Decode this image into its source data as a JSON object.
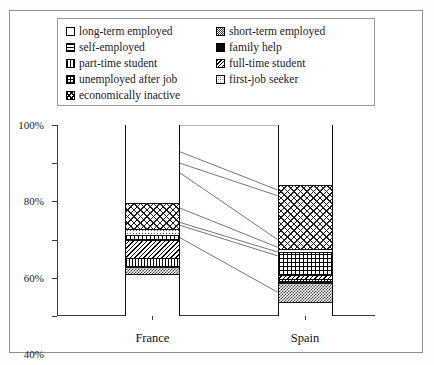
{
  "chart_data": {
    "type": "bar",
    "subtype": "stacked-percentage-with-connectors",
    "title": "",
    "xlabel": "",
    "ylabel": "",
    "categories": [
      "France",
      "Spain"
    ],
    "ylim": [
      0,
      100
    ],
    "ytick_labels": [
      "0%",
      "20%",
      "40%",
      "60%",
      "80%",
      "100%"
    ],
    "ytick_values": [
      0,
      20,
      40,
      60,
      80,
      100
    ],
    "grid": false,
    "legend_position": "top",
    "series": [
      {
        "name": "long-term employed",
        "pattern": "blank",
        "values": [
          41.0,
          12.5
        ]
      },
      {
        "name": "short-term employed",
        "pattern": "checker",
        "values": [
          6.5,
          19.0
        ]
      },
      {
        "name": "self-employed",
        "pattern": "hlines",
        "values": [
          0.0,
          0.0
        ]
      },
      {
        "name": "family help",
        "pattern": "solid",
        "values": [
          1.5,
          2.0
        ]
      },
      {
        "name": "part-time student",
        "pattern": "vlines",
        "values": [
          7.5,
          2.5
        ]
      },
      {
        "name": "full-time student",
        "pattern": "diag",
        "values": [
          18.5,
          4.0
        ]
      },
      {
        "name": "unemployed after job",
        "pattern": "grid",
        "values": [
          5.0,
          23.0
        ]
      },
      {
        "name": "first-job seeker",
        "pattern": "dots",
        "values": [
          6.0,
          3.0
        ]
      },
      {
        "name": "economically inactive",
        "pattern": "xhatch",
        "values": [
          14.0,
          34.0
        ]
      }
    ]
  },
  "legend": {
    "items": [
      {
        "label": "long-term employed",
        "pattern": "blank"
      },
      {
        "label": "short-term employed",
        "pattern": "checker"
      },
      {
        "label": "self-employed",
        "pattern": "hlines"
      },
      {
        "label": "family help",
        "pattern": "solid"
      },
      {
        "label": "part-time student",
        "pattern": "vlines"
      },
      {
        "label": "full-time student",
        "pattern": "diag"
      },
      {
        "label": "unemployed after job",
        "pattern": "grid"
      },
      {
        "label": "first-job seeker",
        "pattern": "dots"
      },
      {
        "label": "economically inactive",
        "pattern": "xhatch"
      }
    ]
  },
  "axes": {
    "y_ticks": [
      "0%",
      "20%",
      "40%",
      "60%",
      "80%",
      "100%"
    ],
    "x_ticks": [
      "France",
      "Spain"
    ]
  },
  "colors": {
    "frame": "#8d8d8d",
    "axis": "#3c3c3c",
    "ink": "#111111",
    "background": "#ffffff"
  }
}
